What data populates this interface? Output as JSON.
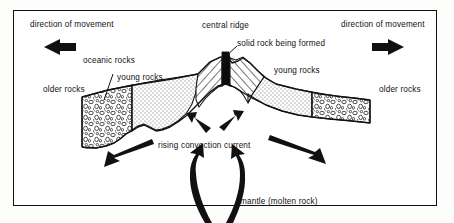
{
  "diagram": {
    "frame": {
      "border_color": "#111111",
      "background": "#ffffff"
    },
    "labels": {
      "direction_left": "direction of movement",
      "direction_right": "direction of movement",
      "central_ridge": "central ridge",
      "solid_rock": "solid rock being formed",
      "oceanic_rocks": "oceanic rocks",
      "young_rocks_left": "young rocks",
      "young_rocks_right": "young rocks",
      "older_rocks_left": "older rocks",
      "older_rocks_right": "older rocks",
      "rising_convection": "rising convection current",
      "mantle": "mantle (molten rock)"
    },
    "icons": {
      "arrow_left": "arrow-left-icon",
      "arrow_right": "arrow-right-icon",
      "spread_arrow_left": "diagonal-arrow-down-left-icon",
      "spread_arrow_right": "diagonal-arrow-down-right-icon",
      "convection_arrow_left": "small-arrow-up-left-icon",
      "convection_arrow_right": "small-arrow-up-right-icon",
      "mantle_arrow_left": "curved-arrow-up-left-icon",
      "mantle_arrow_right": "curved-arrow-up-right-icon",
      "leader_oceanic": "leader-line-icon",
      "leader_solid_rock": "leader-line-icon"
    },
    "colors": {
      "ink": "#111111",
      "stipple_fill": "#e9e9e7",
      "hatch_fill": "#ffffff",
      "dyke_fill": "#0d0d0d",
      "pebble_fill": "#f4f4f2"
    },
    "regions": [
      {
        "name": "older-rocks-left",
        "texture": "pebble-conglomerate"
      },
      {
        "name": "young-rocks-left",
        "texture": "stipple-dots"
      },
      {
        "name": "new-rock-left",
        "texture": "diagonal-hatch"
      },
      {
        "name": "solid-rock-dyke",
        "texture": "solid-black"
      },
      {
        "name": "new-rock-right",
        "texture": "diagonal-hatch"
      },
      {
        "name": "young-rocks-right",
        "texture": "stipple-dots"
      },
      {
        "name": "older-rocks-right",
        "texture": "pebble-conglomerate"
      }
    ]
  }
}
